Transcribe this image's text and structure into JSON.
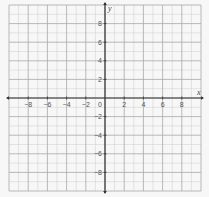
{
  "chart_data": {
    "type": "scatter",
    "title": "",
    "xlabel": "x",
    "ylabel": "y",
    "xlim": [
      -10,
      10
    ],
    "ylim": [
      -10,
      10
    ],
    "grid": true,
    "grid_step": 1,
    "major_grid_step": 2,
    "x_ticks": [
      -8,
      -6,
      -4,
      -2,
      2,
      4,
      6,
      8
    ],
    "x_tick_labels": [
      "−8",
      "−6",
      "−4",
      "−2",
      "2",
      "4",
      "6",
      "8"
    ],
    "y_ticks": [
      8,
      6,
      4,
      2,
      -2,
      -4,
      -6,
      -8
    ],
    "y_tick_labels": [
      "8",
      "6",
      "4",
      "2",
      "−2",
      "−4",
      "−6",
      "−8"
    ],
    "origin_label": "0",
    "series": []
  },
  "colors": {
    "background": "#f7f7f7",
    "minor_grid": "#d4d4d4",
    "major_grid": "#a8a8a8",
    "axis": "#333333"
  }
}
